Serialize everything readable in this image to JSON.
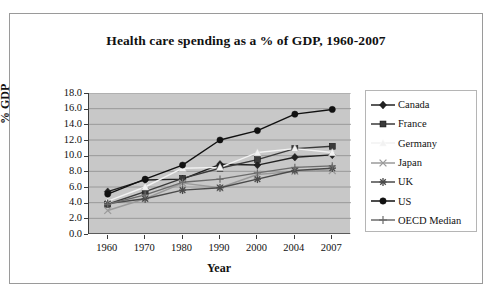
{
  "chart_data": {
    "type": "line",
    "title": "Health care spending as a % of GDP, 1960-2007",
    "xlabel": "Year",
    "ylabel": "% GDP",
    "categories": [
      "1960",
      "1970",
      "1980",
      "1990",
      "2000",
      "2004",
      "2007"
    ],
    "ylim": [
      0.0,
      18.0
    ],
    "ytick_step": 2.0,
    "yticks": [
      "18.0",
      "16.0",
      "14.0",
      "12.0",
      "10.0",
      "8.0",
      "6.0",
      "4.0",
      "2.0",
      "0.0"
    ],
    "grid": "horizontal",
    "legend_position": "right",
    "plot_background": "#c8c8c8",
    "series": [
      {
        "name": "Canada",
        "marker": "diamond",
        "color": "#222222",
        "values": [
          5.4,
          6.9,
          7.0,
          8.9,
          8.8,
          9.8,
          10.1
        ]
      },
      {
        "name": "France",
        "marker": "square",
        "color": "#3a3a3a",
        "values": [
          3.8,
          5.4,
          7.1,
          8.4,
          9.5,
          10.9,
          11.2
        ]
      },
      {
        "name": "Germany",
        "marker": "triangle",
        "color": "#f2f2f2",
        "values": [
          4.2,
          6.0,
          8.4,
          8.5,
          10.4,
          10.9,
          10.4
        ]
      },
      {
        "name": "Japan",
        "marker": "x",
        "color": "#9a9a9a",
        "values": [
          3.0,
          4.5,
          6.5,
          5.9,
          7.6,
          8.0,
          8.1
        ]
      },
      {
        "name": "UK",
        "marker": "star",
        "color": "#4a4a4a",
        "values": [
          3.9,
          4.5,
          5.6,
          5.9,
          7.0,
          8.1,
          8.4
        ]
      },
      {
        "name": "US",
        "marker": "circle",
        "color": "#111111",
        "values": [
          5.1,
          7.0,
          8.8,
          12.0,
          13.2,
          15.3,
          15.9
        ]
      },
      {
        "name": "OECD Median",
        "marker": "plus",
        "color": "#6b6b6b",
        "values": [
          3.8,
          5.0,
          6.6,
          7.0,
          7.8,
          8.5,
          8.7
        ]
      }
    ]
  },
  "legend": {
    "items": [
      {
        "label": "Canada"
      },
      {
        "label": "France"
      },
      {
        "label": "Germany"
      },
      {
        "label": "Japan"
      },
      {
        "label": "UK"
      },
      {
        "label": "US"
      },
      {
        "label": "OECD Median"
      }
    ]
  }
}
